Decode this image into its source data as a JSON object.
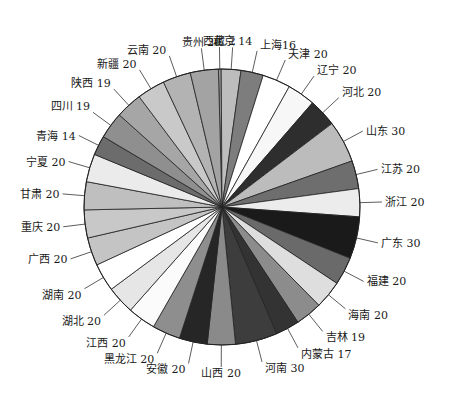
{
  "chart_data": {
    "type": "pie",
    "title": "",
    "start_angle_deg": -91.5,
    "direction": "clockwise",
    "center": [
      222,
      207
    ],
    "radius": 138,
    "slices": [
      {
        "label": "西藏",
        "value": 2,
        "color": "#9a9a9a",
        "display": "西藏 2"
      },
      {
        "label": "北京",
        "value": 14,
        "color": "#bdbdbd",
        "display": "北京 14"
      },
      {
        "label": "上海",
        "value": 16,
        "color": "#7d7d7d",
        "display": "上海16"
      },
      {
        "label": "天津",
        "value": 20,
        "color": "#ffffff",
        "display": "天津 20"
      },
      {
        "label": "辽宁",
        "value": 20,
        "color": "#f7f7f7",
        "display": "辽宁 20"
      },
      {
        "label": "河北",
        "value": 20,
        "color": "#2e2e2e",
        "display": "河北 20"
      },
      {
        "label": "山东",
        "value": 30,
        "color": "#bcbcbc",
        "display": "山东 30"
      },
      {
        "label": "江苏",
        "value": 20,
        "color": "#6e6e6e",
        "display": "江苏 20"
      },
      {
        "label": "浙江",
        "value": 20,
        "color": "#ececec",
        "display": "浙江 20"
      },
      {
        "label": "广东",
        "value": 30,
        "color": "#1a1a1a",
        "display": "广东 30"
      },
      {
        "label": "福建",
        "value": 20,
        "color": "#6a6a6a",
        "display": "福建 20"
      },
      {
        "label": "海南",
        "value": 20,
        "color": "#dedede",
        "display": "海南 20"
      },
      {
        "label": "吉林",
        "value": 19,
        "color": "#8c8c8c",
        "display": "吉林 19"
      },
      {
        "label": "内蒙古",
        "value": 17,
        "color": "#333333",
        "display": "内蒙古 17"
      },
      {
        "label": "河南",
        "value": 30,
        "color": "#3d3d3d",
        "display": "河南 30"
      },
      {
        "label": "山西",
        "value": 20,
        "color": "#8a8a8a",
        "display": "山西 20"
      },
      {
        "label": "安徽",
        "value": 20,
        "color": "#262626",
        "display": "安徽 20"
      },
      {
        "label": "黑龙江",
        "value": 20,
        "color": "#8e8e8e",
        "display": "黑龙江 20"
      },
      {
        "label": "江西",
        "value": 20,
        "color": "#fbfbfb",
        "display": "江西 20"
      },
      {
        "label": "湖北",
        "value": 20,
        "color": "#e6e6e6",
        "display": "湖北 20"
      },
      {
        "label": "湖南",
        "value": 20,
        "color": "#ffffff",
        "display": "湖南 20"
      },
      {
        "label": "广西",
        "value": 20,
        "color": "#c4c4c4",
        "display": "广西 20"
      },
      {
        "label": "重庆",
        "value": 20,
        "color": "#c8c8c8",
        "display": "重庆 20"
      },
      {
        "label": "甘肃",
        "value": 20,
        "color": "#bfbfbf",
        "display": "甘肃 20"
      },
      {
        "label": "宁夏",
        "value": 20,
        "color": "#ebebeb",
        "display": "宁夏 20"
      },
      {
        "label": "青海",
        "value": 14,
        "color": "#6c6c6c",
        "display": "青海 14"
      },
      {
        "label": "四川",
        "value": 19,
        "color": "#8f8f8f",
        "display": "四川 19"
      },
      {
        "label": "陕西",
        "value": 19,
        "color": "#a6a6a6",
        "display": "陕西 19"
      },
      {
        "label": "新疆",
        "value": 20,
        "color": "#c9c9c9",
        "display": "新疆 20"
      },
      {
        "label": "云南",
        "value": 20,
        "color": "#b3b3b3",
        "display": "云南 20"
      },
      {
        "label": "贵州",
        "value": 20,
        "color": "#a3a3a3",
        "display": "贵州 20"
      }
    ],
    "total": 610,
    "legend": "none (leader-line labels)",
    "grid": false
  }
}
